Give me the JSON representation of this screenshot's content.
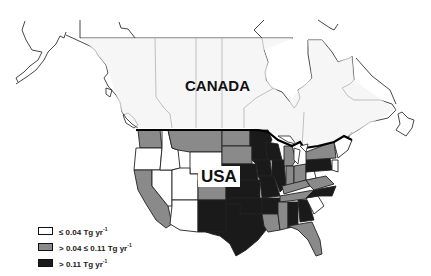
{
  "map": {
    "type": "choropleth",
    "region": "North America (Canada and contiguous USA)",
    "labels": {
      "canada": "CANADA",
      "usa": "USA"
    },
    "colors": {
      "low": "#ffffff",
      "medium": "#8a8a8a",
      "high": "#1a1a1a",
      "canada_fill": "#f0f0f0",
      "outline": "#222222"
    }
  },
  "legend": {
    "items": [
      {
        "class": "low",
        "label": "≤ 0.04 Tg yr",
        "exp": "-1",
        "color": "#ffffff"
      },
      {
        "class": "medium",
        "label": "> 0.04 ≤ 0.11 Tg yr",
        "exp": "-1",
        "color": "#8a8a8a"
      },
      {
        "class": "high",
        "label": "> 0.11 Tg yr",
        "exp": "-1",
        "color": "#1a1a1a"
      }
    ]
  }
}
